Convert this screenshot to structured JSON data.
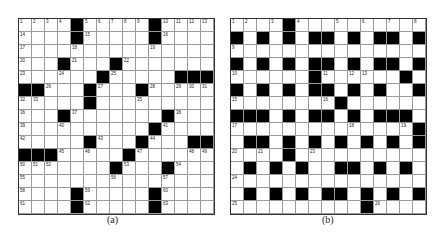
{
  "figures": [
    {
      "id": "a",
      "caption": "(a)",
      "rows": [
        "....#.....#....",
        "....#.....#....",
        "...............",
        "...#...#.......",
        "......#.....###",
        "##...#...#.....",
        ".....#.........",
        "...#.......#...",
        "..........#....",
        ".....#...#...##",
        "###.....#......",
        ".......#...#...",
        "...............",
        "....#.....#....",
        "....#.....#...."
      ],
      "numbers": {
        "0,0": "1",
        "0,1": "2",
        "0,2": "3",
        "0,3": "4",
        "0,5": "5",
        "0,6": "6",
        "0,7": "7",
        "0,8": "8",
        "0,9": "9",
        "0,11": "10",
        "0,12": "11",
        "0,13": "12",
        "0,14": "13",
        "1,0": "14",
        "1,5": "15",
        "1,11": "16",
        "2,0": "17",
        "2,4": "18",
        "2,10": "19",
        "3,0": "20",
        "3,4": "21",
        "3,8": "22",
        "4,0": "23",
        "4,3": "24",
        "4,7": "25",
        "5,2": "26",
        "5,6": "27",
        "5,10": "28",
        "5,12": "29",
        "5,13": "30",
        "5,14": "31",
        "6,0": "32",
        "6,1": "33",
        "6,5": "34",
        "6,9": "35",
        "7,0": "36",
        "7,4": "37",
        "7,12": "38",
        "8,0": "39",
        "8,3": "40",
        "8,11": "41",
        "9,0": "42",
        "9,6": "43",
        "9,10": "44",
        "10,3": "45",
        "10,5": "46",
        "10,9": "47",
        "10,13": "48",
        "10,14": "49",
        "11,0": "50",
        "11,1": "51",
        "11,2": "52",
        "11,8": "53",
        "11,12": "54",
        "12,0": "55",
        "12,7": "56",
        "12,11": "57",
        "13,0": "58",
        "13,5": "59",
        "13,11": "60",
        "14,0": "61",
        "14,5": "62",
        "14,11": "63"
      }
    },
    {
      "id": "b",
      "caption": "(b)",
      "rows": [
        "....#..........",
        "#.#.#.##.#.##.#",
        "...............",
        "#.#.#.##.#.##.#",
        "......#......#.",
        "#.#.#.##.#.#..#",
        "........#......",
        "###.#.##.#.###.",
        "..............#",
        ".##.#.#.#.#.#.#",
        "....#..........",
        ".#.#.#..##.#.#.",
        "...............",
        ".#.#.#.##.#.#.#",
        "..........#...."
      ],
      "numbers": {
        "0,0": "1",
        "0,1": "2",
        "0,3": "3",
        "0,5": "4",
        "0,8": "5",
        "0,10": "6",
        "0,12": "7",
        "0,14": "8",
        "2,0": "9",
        "4,0": "10",
        "4,7": "11",
        "4,9": "12",
        "4,10": "13",
        "5,9": "14",
        "6,0": "15",
        "6,7": "16",
        "8,0": "17",
        "8,9": "18",
        "8,13": "19",
        "10,0": "20",
        "10,2": "21",
        "10,4": "22",
        "10,6": "23",
        "12,0": "24",
        "14,0": "25",
        "14,11": "26"
      }
    }
  ]
}
